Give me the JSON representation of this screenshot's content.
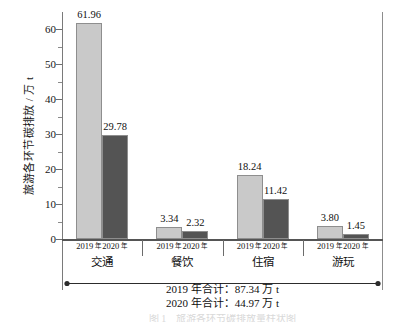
{
  "chart_data": {
    "type": "bar",
    "title": "",
    "subtitle": "",
    "xlabel": "",
    "ylabel": "旅游各环节碳排放 / 万 t",
    "ylim": [
      0,
      65
    ],
    "ytick_values": [
      0,
      10,
      20,
      30,
      40,
      50,
      60
    ],
    "ytick_labels": [
      "0",
      "10",
      "20",
      "30",
      "40",
      "50",
      "60"
    ],
    "yminor_step": 5,
    "grid": false,
    "legend_position": "none",
    "categories": [
      "交通",
      "餐饮",
      "住宿",
      "游玩"
    ],
    "series": [
      {
        "name": "2019 年",
        "color": "#c9c9c9",
        "values": [
          61.96,
          3.34,
          18.24,
          3.8
        ],
        "value_labels": [
          "61.96",
          "3.34",
          "18.24",
          "3.80"
        ]
      },
      {
        "name": "2020 年",
        "color": "#545454",
        "values": [
          29.78,
          2.32,
          11.42,
          1.45
        ],
        "value_labels": [
          "29.78",
          "2.32",
          "11.42",
          "1.45"
        ]
      }
    ],
    "group_tick_labels": [
      [
        "2019",
        "年"
      ],
      [
        "2020",
        "年"
      ]
    ],
    "annotations": [
      "2019 年合计：87.34 万 t",
      "2020 年合计：44.97 万 t"
    ],
    "span_arrow": {
      "style": "double-headed",
      "spans": "交通 → 游玩"
    },
    "caption_cut": "图 1　旅游各环节碳排放量柱状图"
  },
  "axis": {
    "y_title": "旅游各环节碳排放 / 万 t"
  },
  "totals": {
    "line1": "2019 年合计：87.34 万 t",
    "line2": "2020 年合计：44.97 万 t"
  },
  "colors": {
    "bar_2019": "#c9c9c9",
    "bar_2020": "#545454",
    "bar_border": "#8e8e8e",
    "axis": "#6e6e6e",
    "text": "#101010"
  }
}
